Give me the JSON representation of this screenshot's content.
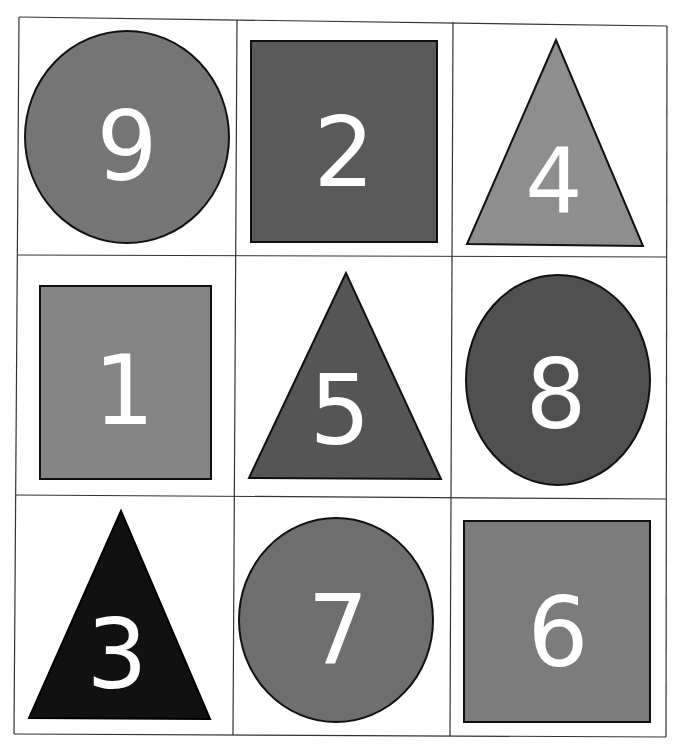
{
  "grid": {
    "rows": 3,
    "cols": 3
  },
  "cells": [
    {
      "number": "9",
      "shape": "circle",
      "color": "#757575"
    },
    {
      "number": "2",
      "shape": "square",
      "color": "#5a5a5a"
    },
    {
      "number": "4",
      "shape": "triangle",
      "color": "#8e8e8e"
    },
    {
      "number": "1",
      "shape": "square",
      "color": "#858585"
    },
    {
      "number": "5",
      "shape": "triangle",
      "color": "#555555"
    },
    {
      "number": "8",
      "shape": "circle",
      "color": "#505050"
    },
    {
      "number": "3",
      "shape": "triangle",
      "color": "#111111"
    },
    {
      "number": "7",
      "shape": "circle",
      "color": "#6e6e6e"
    },
    {
      "number": "6",
      "shape": "square",
      "color": "#7c7c7c"
    }
  ]
}
